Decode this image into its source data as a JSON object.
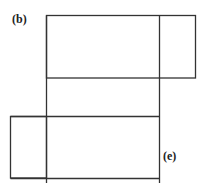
{
  "labels": {
    "b": "(b)",
    "e": "(e)"
  },
  "colors": {
    "stroke": "#333333",
    "background": "#ffffff"
  },
  "shapes": {
    "top_rect": {
      "x": 46,
      "y": 15,
      "w": 150,
      "h": 63
    },
    "top_right_divider_x": 159,
    "middle_band": {
      "x": 46,
      "y": 78,
      "w": 113,
      "h": 38
    },
    "bottom_rect": {
      "x": 10,
      "y": 116,
      "w": 149,
      "h": 62
    },
    "bottom_left_divider_x": 46
  }
}
